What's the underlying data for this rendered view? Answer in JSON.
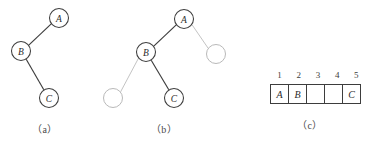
{
  "figure": {
    "panels": [
      {
        "id": "a",
        "caption": "（a）",
        "kind": "binary-tree",
        "description": "binary tree with only real nodes shown",
        "nodes": [
          {
            "id": "A",
            "label": "A",
            "type": "filled",
            "cx": 59,
            "cy": 18,
            "r": 9.5
          },
          {
            "id": "B",
            "label": "B",
            "type": "filled",
            "cx": 21,
            "cy": 51,
            "r": 9.5
          },
          {
            "id": "C",
            "label": "C",
            "type": "filled",
            "cx": 49,
            "cy": 98,
            "r": 9.5
          }
        ],
        "edges": [
          {
            "from": "A",
            "to": "B",
            "style": "solid"
          },
          {
            "from": "B",
            "to": "C",
            "style": "solid"
          }
        ]
      },
      {
        "id": "b",
        "caption": "（b）",
        "kind": "binary-tree",
        "description": "same binary tree with empty (null) child nodes drawn",
        "nodes": [
          {
            "id": "A",
            "label": "A",
            "type": "filled",
            "cx": 84,
            "cy": 19,
            "r": 9.5
          },
          {
            "id": "B",
            "label": "B",
            "type": "filled",
            "cx": 46,
            "cy": 52,
            "r": 9.5
          },
          {
            "id": "C",
            "label": "C",
            "type": "filled",
            "cx": 74,
            "cy": 98,
            "r": 9.5
          },
          {
            "id": "E1",
            "label": "",
            "type": "empty",
            "cx": 116,
            "cy": 54,
            "r": 9.5
          },
          {
            "id": "E2",
            "label": "",
            "type": "empty",
            "cx": 13,
            "cy": 98,
            "r": 9.5
          }
        ],
        "edges": [
          {
            "from": "A",
            "to": "B",
            "style": "solid"
          },
          {
            "from": "A",
            "to": "E1",
            "style": "faint"
          },
          {
            "from": "B",
            "to": "E2",
            "style": "faint"
          },
          {
            "from": "B",
            "to": "C",
            "style": "solid"
          }
        ]
      },
      {
        "id": "c",
        "caption": "（c）",
        "kind": "array",
        "description": "array / sequential storage representation of the binary tree",
        "indices": [
          "1",
          "2",
          "3",
          "4",
          "5"
        ],
        "cells": [
          "A",
          "B",
          "",
          "",
          "C"
        ]
      }
    ]
  },
  "colors": {
    "background": "#ffffff",
    "node_stroke": "#3d3d3d",
    "node_fill": "#ffffff",
    "empty_node_stroke": "#b9b9b9",
    "edge_solid": "#3d3d3d",
    "edge_faint": "#c0c0c0",
    "text": "#2b2b2b",
    "caption_text": "#4a4a4a",
    "table_border": "#3d3d3d"
  }
}
